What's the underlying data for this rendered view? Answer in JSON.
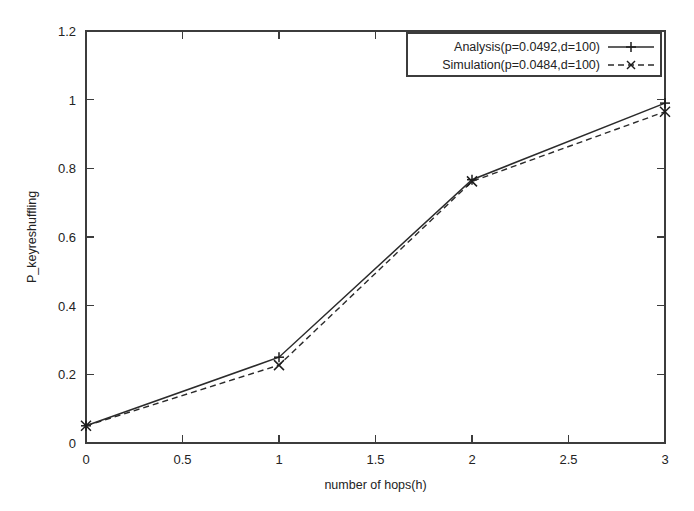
{
  "chart_data": {
    "type": "line",
    "title": "",
    "xlabel": "number of hops(h)",
    "ylabel": "P_keyreshuffling",
    "xlim": [
      0,
      3
    ],
    "ylim": [
      0,
      1.2
    ],
    "grid": false,
    "legend_position": "top-right",
    "x": [
      0,
      1,
      2,
      3
    ],
    "xticks": [
      "0",
      "0.5",
      "1",
      "1.5",
      "2",
      "2.5",
      "3"
    ],
    "xtick_values": [
      0,
      0.5,
      1,
      1.5,
      2,
      2.5,
      3
    ],
    "yticks": [
      "0",
      "0.2",
      "0.4",
      "0.6",
      "0.8",
      "1",
      "1.2"
    ],
    "ytick_values": [
      0,
      0.2,
      0.4,
      0.6,
      0.8,
      1,
      1.2
    ],
    "series": [
      {
        "name": "Analysis(p=0.0492,d=100)",
        "values": [
          0.05,
          0.25,
          0.767,
          0.99
        ],
        "linestyle": "solid",
        "marker": "plus",
        "color": "#2b2b2b"
      },
      {
        "name": "Simulation(p=0.0484,d=100)",
        "values": [
          0.05,
          0.227,
          0.762,
          0.965
        ],
        "linestyle": "dashed",
        "marker": "cross",
        "color": "#2b2b2b"
      }
    ]
  },
  "legend": {
    "entries": [
      {
        "label": "Analysis(p=0.0492,d=100)"
      },
      {
        "label": "Simulation(p=0.0484,d=100)"
      }
    ]
  },
  "colors": {
    "background": "#ffffff",
    "axis": "#3c3c3c",
    "line": "#2b2b2b",
    "text": "#232323"
  }
}
